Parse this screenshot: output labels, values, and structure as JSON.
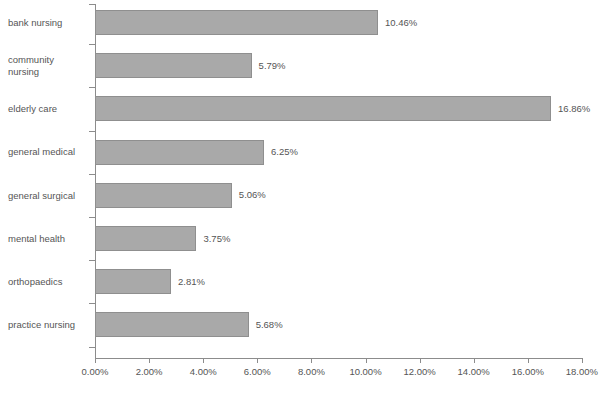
{
  "chart_data": {
    "type": "bar",
    "orientation": "horizontal",
    "title": "",
    "xlabel": "",
    "ylabel": "",
    "xlim": [
      0,
      18
    ],
    "xtick_labels": [
      "0.00%",
      "2.00%",
      "4.00%",
      "6.00%",
      "8.00%",
      "10.00%",
      "12.00%",
      "14.00%",
      "16.00%",
      "18.00%"
    ],
    "xtick_values": [
      0,
      2,
      4,
      6,
      8,
      10,
      12,
      14,
      16,
      18
    ],
    "grid": false,
    "legend": "none",
    "categories": [
      "bank nursing",
      "community\nnursing",
      "elderly care",
      "general medical",
      "general surgical",
      "mental health",
      "orthopaedics",
      "practice nursing"
    ],
    "values": [
      10.46,
      5.79,
      16.86,
      6.25,
      5.06,
      3.75,
      2.81,
      5.68
    ],
    "value_labels": [
      "10.46%",
      "5.79%",
      "16.86%",
      "6.25%",
      "5.06%",
      "3.75%",
      "2.81%",
      "5.68%"
    ],
    "bar_color": "#a9a9a9",
    "bar_border_color": "#8f8f8f",
    "axis_color": "#8c8c8c",
    "text_color": "#555555"
  },
  "clipped": {
    "top": "",
    "bottom": ""
  }
}
